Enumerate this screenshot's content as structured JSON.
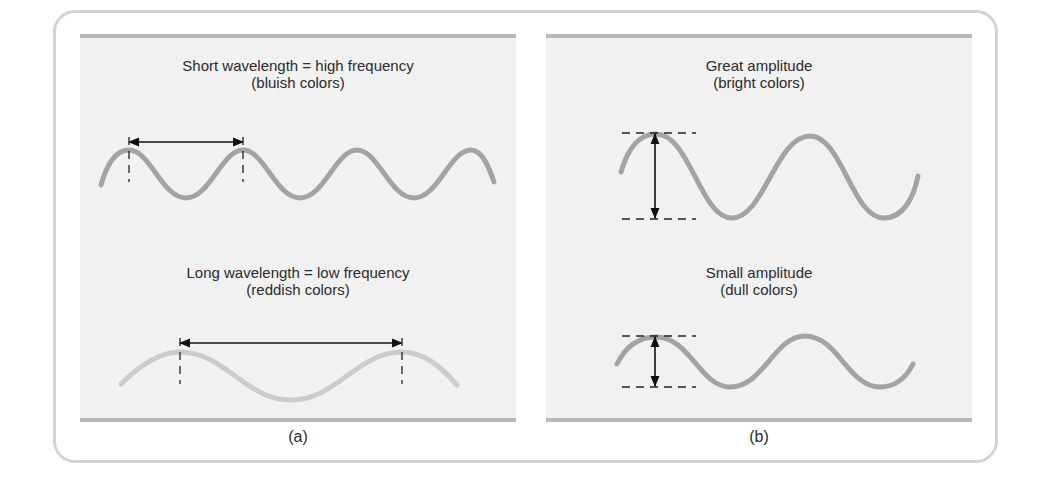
{
  "figure": {
    "panel_a": {
      "label": "(a)",
      "top_caption": {
        "line1": "Short wavelength = high frequency",
        "line2": "(bluish colors)"
      },
      "bottom_caption": {
        "line1": "Long wavelength = low frequency",
        "line2": "(reddish colors)"
      }
    },
    "panel_b": {
      "label": "(b)",
      "top_caption": {
        "line1": "Great amplitude",
        "line2": "(bright colors)"
      },
      "bottom_caption": {
        "line1": "Small amplitude",
        "line2": "(dull colors)"
      }
    },
    "colors": {
      "panel_bg": "#f1f1f1",
      "panel_rule": "#b9b9b9",
      "frame": "#d3d3d3",
      "wave_dark": "#a3a3a3",
      "wave_light": "#cbcbcb",
      "arrow": "#111111",
      "text": "#2b2b2b"
    }
  }
}
